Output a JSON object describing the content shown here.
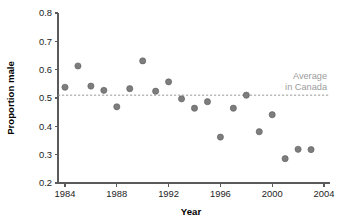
{
  "chart_data": {
    "type": "scatter",
    "title": "",
    "xlabel": "Year",
    "ylabel": "Proportion male",
    "xlim": [
      1983,
      2004
    ],
    "ylim": [
      0.2,
      0.8
    ],
    "xticks": [
      1984,
      1988,
      1992,
      1996,
      2000,
      2004
    ],
    "xtick_labels": [
      "1984",
      "1988",
      "1992",
      "1996",
      "2000",
      "2004"
    ],
    "yticks": [
      0.2,
      0.3,
      0.4,
      0.5,
      0.6,
      0.7,
      0.8
    ],
    "ytick_labels": [
      "0.2",
      "0.3",
      "0.4",
      "0.5",
      "0.6",
      "0.7",
      "0.8"
    ],
    "grid": false,
    "legend_position": "inside-right",
    "series": [
      {
        "name": "Proportion male",
        "marker": "circle",
        "color": "#7d7d7d",
        "x": [
          1984,
          1985,
          1986,
          1987,
          1988,
          1989,
          1990,
          1991,
          1992,
          1993,
          1994,
          1995,
          1996,
          1997,
          1998,
          1999,
          2000,
          2001,
          2002,
          2003
        ],
        "y": [
          0.538,
          0.613,
          0.542,
          0.527,
          0.469,
          0.533,
          0.631,
          0.524,
          0.557,
          0.497,
          0.464,
          0.487,
          0.362,
          0.464,
          0.51,
          0.381,
          0.441,
          0.286,
          0.319,
          0.318
        ]
      }
    ],
    "annotations": [
      {
        "name": "average-in-canada",
        "type": "hline",
        "value": 0.51,
        "style": "dashed",
        "color": "#9a9a9a",
        "label_line1": "Average",
        "label_line2": "in Canada"
      }
    ]
  },
  "axes": {
    "x_title": "Year",
    "y_title": "Proportion male"
  },
  "annotation_text": {
    "line1": "Average",
    "line2": "in Canada"
  }
}
